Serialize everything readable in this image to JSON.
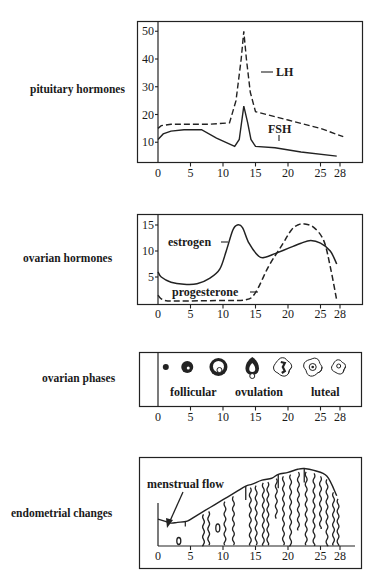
{
  "labels": {
    "pituitary": "pituitary hormones",
    "ovarian_hormones": "ovarian hormones",
    "ovarian_phases": "ovarian phases",
    "endometrial": "endometrial changes"
  },
  "annotations": {
    "lh": "LH",
    "fsh": "FSH",
    "estrogen": "estrogen",
    "progesterone": "progesterone",
    "follicular": "follicular",
    "ovulation": "ovulation",
    "luteal": "luteal",
    "menstrual_flow": "menstrual flow"
  },
  "x_ticks": [
    "0",
    "5",
    "10",
    "15",
    "20",
    "25",
    "28"
  ],
  "chart_data": [
    {
      "type": "line",
      "title": "pituitary hormones",
      "xlabel": "day of cycle",
      "x_ticks": [
        0,
        5,
        10,
        15,
        20,
        25,
        28
      ],
      "y_ticks": [
        10,
        20,
        30,
        40,
        50
      ],
      "ylim": [
        3,
        53
      ],
      "series": [
        {
          "name": "LH",
          "style": "dashed",
          "x": [
            0,
            0.5,
            2,
            5,
            8,
            11,
            12,
            12.8,
            13.2,
            13.6,
            14.2,
            15,
            20,
            25,
            28.5
          ],
          "y": [
            15,
            16,
            16.5,
            16.5,
            16.5,
            17,
            25,
            40,
            50,
            40,
            28,
            21,
            18,
            15,
            12
          ]
        },
        {
          "name": "FSH",
          "style": "solid",
          "x": [
            0,
            0.8,
            2,
            4,
            6.7,
            9,
            11.8,
            12.5,
            13.2,
            13.8,
            14.3,
            15,
            18,
            22,
            27.5
          ],
          "y": [
            11,
            13,
            14,
            14.5,
            14.5,
            11.5,
            8.5,
            11,
            23,
            17,
            11,
            8.5,
            8,
            6.5,
            5
          ]
        }
      ]
    },
    {
      "type": "line",
      "title": "ovarian hormones",
      "xlabel": "day of cycle",
      "x_ticks": [
        0,
        5,
        10,
        15,
        20,
        25,
        28
      ],
      "y_ticks": [
        5,
        10,
        15
      ],
      "ylim": [
        0,
        16
      ],
      "series": [
        {
          "name": "estrogen",
          "style": "solid",
          "x": [
            0,
            0.5,
            2,
            4,
            6,
            8,
            9.5,
            10.5,
            11.5,
            12.2,
            13,
            14,
            15.5,
            16.5,
            18,
            20,
            22,
            23.5,
            25,
            26.5,
            27.5
          ],
          "y": [
            6,
            5,
            4,
            3.6,
            3.7,
            4.8,
            6.5,
            10,
            14,
            15,
            14.5,
            11.5,
            9,
            8.8,
            9.5,
            10.5,
            11.5,
            12,
            11.5,
            10,
            7.5
          ]
        },
        {
          "name": "progesterone",
          "style": "dashed",
          "x": [
            0,
            0.5,
            1.5,
            5,
            10,
            13.5,
            15,
            17,
            19,
            20.5,
            21.5,
            22.5,
            24,
            25.5,
            26.5,
            27.5
          ],
          "y": [
            1.5,
            0.8,
            0.4,
            0.4,
            0.5,
            0.6,
            2,
            7,
            11,
            14,
            15,
            15.2,
            14.5,
            12,
            7,
            0.5
          ]
        }
      ]
    },
    {
      "type": "diagram",
      "title": "ovarian phases",
      "phases": [
        "follicular",
        "ovulation",
        "luteal"
      ],
      "follicles": [
        {
          "day": 1.2,
          "stage": "primary",
          "r": 3
        },
        {
          "day": 4.5,
          "stage": "growing",
          "r": 6
        },
        {
          "day": 9.3,
          "stage": "antral",
          "r": 9
        },
        {
          "day": 14.5,
          "stage": "ovulating",
          "r": 9
        },
        {
          "day": 19.2,
          "stage": "corpus luteum",
          "r": 9
        },
        {
          "day": 23.8,
          "stage": "corpus luteum",
          "r": 9
        },
        {
          "day": 27.8,
          "stage": "regressing",
          "r": 7
        }
      ]
    },
    {
      "type": "area",
      "title": "endometrial changes",
      "x_ticks": [
        0,
        5,
        10,
        15,
        20,
        25,
        28
      ],
      "thickness_profile": {
        "x": [
          0,
          1,
          2,
          3,
          4.5,
          6,
          8,
          10,
          12,
          13.5,
          14.5,
          16,
          17.5,
          18.5,
          20,
          21.5,
          22.5,
          24,
          26,
          27.5
        ],
        "y": [
          2,
          1.5,
          1,
          1.2,
          1.5,
          3,
          5,
          7,
          9,
          10.5,
          11,
          12,
          12.5,
          13.5,
          14,
          14.8,
          15,
          14.5,
          13,
          8
        ]
      }
    }
  ]
}
